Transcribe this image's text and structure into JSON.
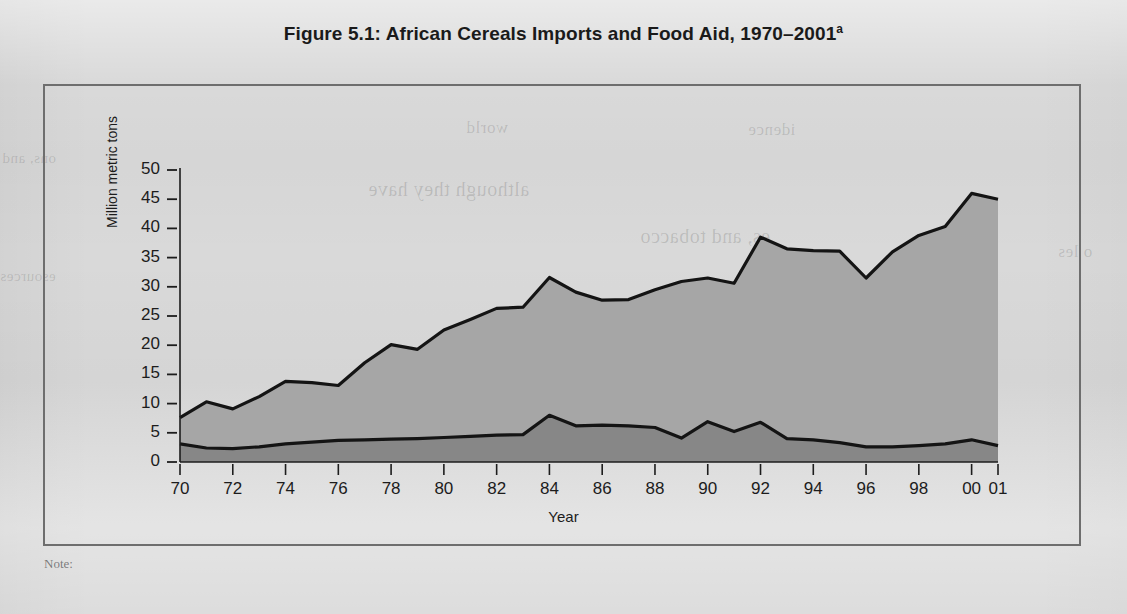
{
  "figure": {
    "title_main": "Figure 5.1:  African Cereals Imports and Food Aid, 1970–2001",
    "title_superscript": "a",
    "note_label": "Note:"
  },
  "colors": {
    "page_background": "#d9d9d9",
    "frame_border": "#6e6e6e",
    "imports_band": "#a6a6a6",
    "food_aid_band": "#878787",
    "line": "#141414",
    "text": "#1c1c1c"
  },
  "chart_data": {
    "type": "area",
    "title": "African Cereals Imports and Food Aid, 1970–2001",
    "xlabel": "Year",
    "ylabel": "Million metric tons",
    "ylim": [
      0,
      50
    ],
    "ytick_step": 5,
    "yticks": [
      0,
      5,
      10,
      15,
      20,
      25,
      30,
      35,
      40,
      45,
      50
    ],
    "xlim": [
      1970,
      2001
    ],
    "xticks": [
      1970,
      1972,
      1974,
      1976,
      1978,
      1980,
      1982,
      1984,
      1986,
      1988,
      1990,
      1992,
      1994,
      1996,
      1998,
      2000,
      2001
    ],
    "xtick_labels": [
      "70",
      "72",
      "74",
      "76",
      "78",
      "80",
      "82",
      "84",
      "86",
      "88",
      "90",
      "92",
      "94",
      "96",
      "98",
      "00",
      "01"
    ],
    "grid": false,
    "legend": "none",
    "stacked": false,
    "x": [
      1970,
      1971,
      1972,
      1973,
      1974,
      1975,
      1976,
      1977,
      1978,
      1979,
      1980,
      1981,
      1982,
      1983,
      1984,
      1985,
      1986,
      1987,
      1988,
      1989,
      1990,
      1991,
      1992,
      1993,
      1994,
      1995,
      1996,
      1997,
      1998,
      1999,
      2000,
      2001
    ],
    "series": [
      {
        "name": "Cereals imports (total)",
        "color": "#a6a6a6",
        "values": [
          7.6,
          10.3,
          9.1,
          11.2,
          13.8,
          13.6,
          13.1,
          17.0,
          20.1,
          19.3,
          22.6,
          24.4,
          26.3,
          26.5,
          31.6,
          29.1,
          27.7,
          27.8,
          29.5,
          30.9,
          31.5,
          30.6,
          38.5,
          36.5,
          36.2,
          36.1,
          31.5,
          36.0,
          38.8,
          40.3,
          46.0,
          45.0
        ]
      },
      {
        "name": "Food aid",
        "color": "#878787",
        "values": [
          3.1,
          2.4,
          2.3,
          2.6,
          3.1,
          3.4,
          3.7,
          3.8,
          3.9,
          4.0,
          4.2,
          4.4,
          4.6,
          4.7,
          8.0,
          6.2,
          6.3,
          6.2,
          5.9,
          4.1,
          6.9,
          5.2,
          6.8,
          4.0,
          3.8,
          3.3,
          2.6,
          2.6,
          2.8,
          3.1,
          3.8,
          2.8
        ]
      }
    ]
  },
  "ghost_text": [
    {
      "text": "ons, and",
      "x": 2,
      "y": 150,
      "size": 15
    },
    {
      "text": "esources",
      "x": 0,
      "y": 268,
      "size": 15
    },
    {
      "text": "although they have",
      "x": 368,
      "y": 178,
      "size": 20
    },
    {
      "text": "es, and tobacco",
      "x": 640,
      "y": 225,
      "size": 20
    },
    {
      "text": "o les",
      "x": 1058,
      "y": 242,
      "size": 17
    },
    {
      "text": "world",
      "x": 466,
      "y": 118,
      "size": 17
    },
    {
      "text": "idence",
      "x": 748,
      "y": 120,
      "size": 17
    }
  ]
}
